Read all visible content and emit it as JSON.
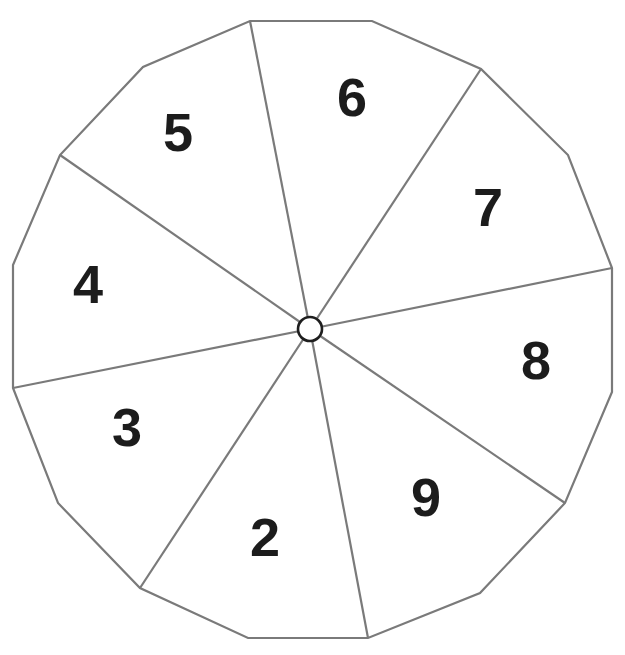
{
  "diagram": {
    "type": "spinner",
    "colors": {
      "line": "#7a7a7a",
      "text": "#1c1c1c",
      "background": "#ffffff",
      "hub_stroke": "#1e1e1e"
    },
    "sectors": [
      {
        "label": "6",
        "x": 352,
        "y": 97
      },
      {
        "label": "7",
        "x": 488,
        "y": 207
      },
      {
        "label": "8",
        "x": 536,
        "y": 360
      },
      {
        "label": "9",
        "x": 426,
        "y": 497
      },
      {
        "label": "2",
        "x": 265,
        "y": 537
      },
      {
        "label": "3",
        "x": 127,
        "y": 427
      },
      {
        "label": "4",
        "x": 88,
        "y": 284
      },
      {
        "label": "5",
        "x": 178,
        "y": 132
      }
    ],
    "center": {
      "x": 310,
      "y": 329,
      "r": 12
    }
  }
}
